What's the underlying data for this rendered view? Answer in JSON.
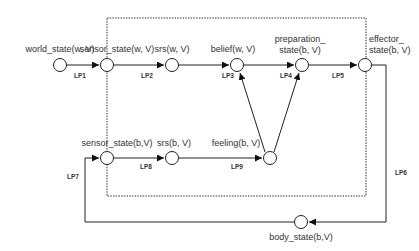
{
  "diagram": {
    "boundary": "dotted-rectangle",
    "nodes": {
      "world_state_w": "world_state(w, V)",
      "sensor_state_w": "sensor_state(w, V)",
      "srs_w": "srs(w, V)",
      "belief_w": "belief(w, V)",
      "preparation_b_line1": "preparation_",
      "preparation_b_line2": "state(b, V)",
      "effector_b_line1": "effector_",
      "effector_b_line2": "state(b, V)",
      "sensor_state_b": "sensor_state(b,V)",
      "srs_b": "srs(b, V)",
      "feeling_b": "feeling(b, V)",
      "body_state_b": "body_state(b,V)"
    },
    "links": {
      "lp1": "LP1",
      "lp2": "LP2",
      "lp3": "LP3",
      "lp4": "LP4",
      "lp5": "LP5",
      "lp6": "LP6",
      "lp7": "LP7",
      "lp8": "LP8",
      "lp9": "LP9"
    },
    "edges": [
      {
        "from": "world_state(w, V)",
        "to": "sensor_state(w, V)",
        "label": "LP1"
      },
      {
        "from": "sensor_state(w, V)",
        "to": "srs(w, V)",
        "label": "LP2"
      },
      {
        "from": "srs(w, V)",
        "to": "belief(w, V)",
        "label": "LP3"
      },
      {
        "from": "feeling(b, V)",
        "to": "belief(w, V)",
        "label": "LP3"
      },
      {
        "from": "belief(w, V)",
        "to": "preparation_state(b, V)",
        "label": "LP4"
      },
      {
        "from": "feeling(b, V)",
        "to": "preparation_state(b, V)",
        "label": "LP4"
      },
      {
        "from": "preparation_state(b, V)",
        "to": "effector_state(b, V)",
        "label": "LP5"
      },
      {
        "from": "effector_state(b, V)",
        "to": "body_state(b,V)",
        "label": "LP6"
      },
      {
        "from": "body_state(b,V)",
        "to": "sensor_state(b,V)",
        "label": "LP7"
      },
      {
        "from": "sensor_state(b,V)",
        "to": "srs(b, V)",
        "label": "LP8"
      },
      {
        "from": "srs(b, V)",
        "to": "feeling(b, V)",
        "label": "LP9"
      }
    ]
  }
}
